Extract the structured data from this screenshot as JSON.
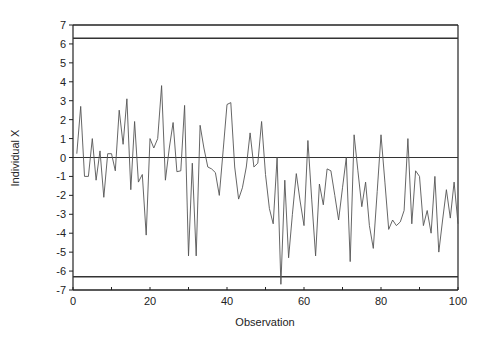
{
  "chart_data": {
    "type": "line",
    "title": "",
    "xlabel": "Observation",
    "ylabel": "Individual X",
    "xlim": [
      0,
      100
    ],
    "ylim": [
      -7,
      7
    ],
    "xticks": [
      0,
      20,
      40,
      60,
      80,
      100
    ],
    "yticks": [
      7,
      6,
      5,
      4,
      3,
      2,
      1,
      0,
      -1,
      -2,
      -3,
      -4,
      -5,
      -6,
      -7
    ],
    "grid": false,
    "legend": null,
    "reference_lines": [
      {
        "name": "UCL",
        "value": 6.3
      },
      {
        "name": "Center",
        "value": 0
      },
      {
        "name": "LCL",
        "value": -6.3
      }
    ],
    "series": [
      {
        "name": "Individual X",
        "x": [
          1,
          2,
          3,
          4,
          5,
          6,
          7,
          8,
          9,
          10,
          11,
          12,
          13,
          14,
          15,
          16,
          17,
          18,
          19,
          20,
          21,
          22,
          23,
          24,
          25,
          26,
          27,
          28,
          29,
          30,
          31,
          32,
          33,
          34,
          35,
          36,
          37,
          38,
          39,
          40,
          41,
          42,
          43,
          44,
          45,
          46,
          47,
          48,
          49,
          50,
          51,
          52,
          53,
          54,
          55,
          56,
          57,
          58,
          59,
          60,
          61,
          62,
          63,
          64,
          65,
          66,
          67,
          68,
          69,
          70,
          71,
          72,
          73,
          74,
          75,
          76,
          77,
          78,
          79,
          80,
          81,
          82,
          83,
          84,
          85,
          86,
          87,
          88,
          89,
          90,
          91,
          92,
          93,
          94,
          95,
          96,
          97,
          98,
          99,
          100
        ],
        "values": [
          0.2,
          2.7,
          -1.0,
          -1.0,
          1.0,
          -1.2,
          0.35,
          -2.1,
          0.2,
          0.2,
          -0.7,
          2.5,
          0.7,
          3.1,
          -1.7,
          1.9,
          -1.3,
          -0.9,
          -4.1,
          1.0,
          0.5,
          1.0,
          3.8,
          -1.2,
          0.5,
          1.85,
          -0.75,
          -0.7,
          2.75,
          -5.2,
          -0.3,
          -5.2,
          1.7,
          0.5,
          -0.5,
          -0.6,
          -0.8,
          -2.0,
          0.4,
          2.8,
          2.9,
          -0.5,
          -2.2,
          -1.6,
          -0.5,
          1.3,
          -0.5,
          -0.3,
          1.9,
          -0.9,
          -2.7,
          -3.5,
          0.0,
          -6.7,
          -1.2,
          -5.3,
          -3.0,
          -0.85,
          -2.3,
          -3.6,
          0.9,
          -2.2,
          -5.2,
          -1.4,
          -2.5,
          -0.6,
          -0.7,
          -2.0,
          -3.3,
          -1.6,
          0.0,
          -5.5,
          1.2,
          -0.7,
          -2.6,
          -1.3,
          -3.6,
          -4.8,
          -1.8,
          1.2,
          -1.3,
          -3.8,
          -3.3,
          -3.6,
          -3.4,
          -2.8,
          1.0,
          -3.5,
          -0.7,
          -1.0,
          -3.6,
          -2.8,
          -4.0,
          -1.0,
          -5.0,
          -3.3,
          -1.7,
          -3.2,
          -1.3,
          -3.5
        ]
      }
    ]
  },
  "colors": {
    "line": "#555555",
    "axis": "#222222",
    "limit": "#333333"
  }
}
